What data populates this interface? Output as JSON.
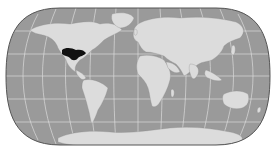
{
  "map": {
    "projection": "pseudo-cylindrical world map",
    "colors": {
      "background": "#ffffff",
      "ocean": "#9a9a9a",
      "land": "#dcdcdc",
      "graticule": "#e6e6e6",
      "outline": "#555555",
      "highlight": "#111111"
    },
    "highlighted_region": "Southwestern United States / Northern Mexico",
    "graticule": true
  }
}
